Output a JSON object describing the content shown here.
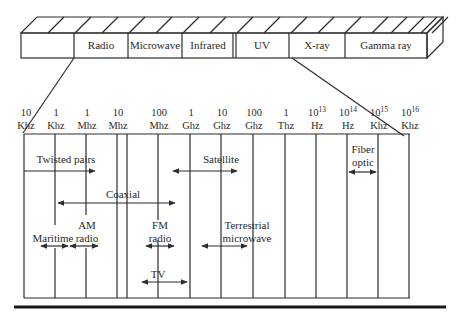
{
  "spectrum_bar": {
    "bands": [
      {
        "label": ""
      },
      {
        "label": "Radio"
      },
      {
        "label": "Microwave"
      },
      {
        "label": "Infrared"
      },
      {
        "label": ""
      },
      {
        "label": "UV"
      },
      {
        "label": "X-ray"
      },
      {
        "label": "Gamma ray"
      }
    ]
  },
  "frequency_scale": [
    {
      "value": "10",
      "unit": "Khz"
    },
    {
      "value": "1",
      "unit": "Khz"
    },
    {
      "value": "1",
      "unit": "Mhz"
    },
    {
      "value": "10",
      "unit": "Mhz"
    },
    {
      "value": "100",
      "unit": "Mhz"
    },
    {
      "value": "1",
      "unit": "Ghz"
    },
    {
      "value": "10",
      "unit": "Ghz"
    },
    {
      "value": "100",
      "unit": "Ghz"
    },
    {
      "value": "1",
      "unit": "Thz"
    },
    {
      "value": "10",
      "exp": "13",
      "unit": "Hz"
    },
    {
      "value": "10",
      "exp": "14",
      "unit": "Hz"
    },
    {
      "value": "10",
      "exp": "15",
      "unit": "Khz"
    },
    {
      "value": "10",
      "exp": "16",
      "unit": "Khz"
    }
  ],
  "media": [
    {
      "name": "twisted-pairs",
      "lines": [
        "Twisted pairs"
      ],
      "arrow": "right"
    },
    {
      "name": "satellite",
      "lines": [
        "Satellite"
      ],
      "arrow": "both"
    },
    {
      "name": "fiber-optic",
      "lines": [
        "Fiber",
        "optic"
      ],
      "arrow": "both"
    },
    {
      "name": "coaxial",
      "lines": [
        "Coaxial"
      ],
      "arrow": "both"
    },
    {
      "name": "am-radio",
      "lines": [
        "AM",
        "radio"
      ],
      "arrow": "both"
    },
    {
      "name": "maritime",
      "lines": [
        "Maritime"
      ],
      "arrow": "both"
    },
    {
      "name": "fm-radio",
      "lines": [
        "FM",
        "radio"
      ],
      "arrow": "both"
    },
    {
      "name": "terrestrial-microwave",
      "lines": [
        "Terrestrial",
        "microwave"
      ],
      "arrow": "both"
    },
    {
      "name": "tv",
      "lines": [
        "TV"
      ],
      "arrow": "both"
    }
  ],
  "colors": {
    "ink": "#2d2d2d",
    "background": "#ffffff"
  }
}
